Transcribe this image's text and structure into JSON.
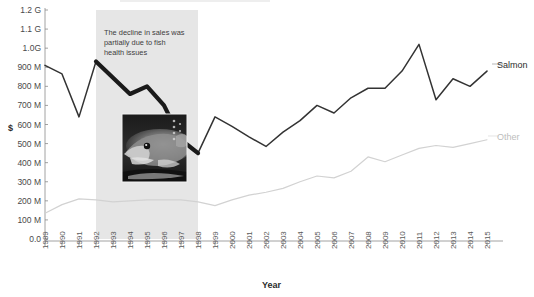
{
  "chart_data": {
    "type": "line",
    "title": "",
    "xlabel": "Year",
    "ylabel": "$",
    "ylim": [
      0,
      1200000000
    ],
    "ytick_labels": [
      "1.2 G",
      "1.1 G",
      "1.0G",
      "900 M",
      "800 M",
      "700 M",
      "600 M",
      "500 M",
      "400 M",
      "300 M",
      "200 M",
      "100 M",
      "0.0"
    ],
    "ytick_values": [
      1200000000,
      1100000000,
      1000000000,
      900000000,
      800000000,
      700000000,
      600000000,
      500000000,
      400000000,
      300000000,
      200000000,
      100000000,
      0
    ],
    "grid": false,
    "legend_position": "right-inline",
    "categories": [
      "1989",
      "1990",
      "1991",
      "1992",
      "1993",
      "1994",
      "1995",
      "1996",
      "1997",
      "1998",
      "1999",
      "2000",
      "2001",
      "2002",
      "2003",
      "2004",
      "2005",
      "2006",
      "2007",
      "2008",
      "2009",
      "2010",
      "2011",
      "2012",
      "2013",
      "2014",
      "2015"
    ],
    "series": [
      {
        "name": "Salmon",
        "color": "#333333",
        "values": [
          910000000,
          865000000,
          640000000,
          930000000,
          845000000,
          760000000,
          800000000,
          700000000,
          520000000,
          450000000,
          640000000,
          590000000,
          535000000,
          485000000,
          560000000,
          620000000,
          700000000,
          660000000,
          740000000,
          790000000,
          790000000,
          880000000,
          1020000000,
          730000000,
          840000000,
          800000000,
          880000000
        ],
        "highlight_range": [
          "1992",
          "1998"
        ],
        "highlight_note": "bold emphasized segment over highlighted band"
      },
      {
        "name": "Other",
        "color": "#d2d2d2",
        "values": [
          135000000,
          180000000,
          210000000,
          205000000,
          195000000,
          200000000,
          205000000,
          205000000,
          205000000,
          195000000,
          175000000,
          205000000,
          230000000,
          245000000,
          265000000,
          300000000,
          330000000,
          320000000,
          355000000,
          430000000,
          405000000,
          440000000,
          475000000,
          490000000,
          480000000,
          500000000,
          520000000
        ]
      }
    ],
    "annotations": [
      {
        "name": "decline-note",
        "text_lines": [
          "The decline in sales was",
          "partially due to fish",
          "health issues"
        ],
        "band_start": "1992",
        "band_end": "1998",
        "band_color": "#e6e6e6"
      },
      {
        "name": "fish-photo",
        "kind": "image",
        "description": "black and white photograph of a salmon fish"
      }
    ]
  },
  "labels": {
    "salmon": "Salmon",
    "other": "Other",
    "x_axis_title": "Year",
    "y_axis_title": "$"
  },
  "annotation": {
    "line1": "The decline in sales was",
    "line2": "partially due to fish",
    "line3": "health issues"
  }
}
